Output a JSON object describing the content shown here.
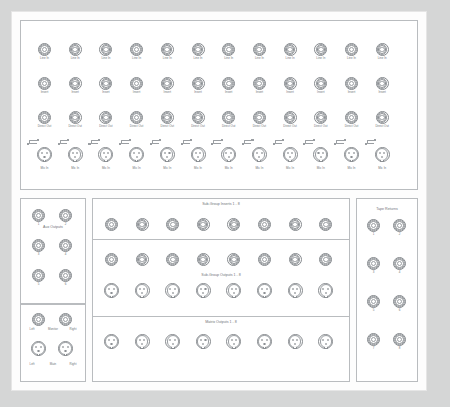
{
  "diagram": {
    "channel_count": 12,
    "row_labels": {
      "line_in": "Line In",
      "insert": "Insert",
      "direct_out": "Direct Out",
      "mic_in": "Mic In"
    }
  },
  "input_panel": {
    "rows": [
      {
        "name": "line-in-row",
        "label": "Line In",
        "type": "trs",
        "count": 12
      },
      {
        "name": "insert-row",
        "label": "Insert",
        "type": "trs",
        "count": 12
      },
      {
        "name": "direct-out-row",
        "label": "Direct Out",
        "type": "trs",
        "count": 12
      },
      {
        "name": "mic-in-row",
        "label": "Mic In",
        "type": "xlr",
        "count": 12
      }
    ]
  },
  "aux_panel": {
    "label": "Aux Outputs",
    "type": "trs",
    "numbers": [
      "1",
      "2",
      "3",
      "4",
      "5",
      "6"
    ]
  },
  "monitor_panel": {
    "monitor": {
      "left": "Left",
      "center": "Monitor",
      "right": "Right",
      "type": "trs"
    },
    "main": {
      "left": "Left",
      "center": "Main",
      "right": "Right",
      "type": "xlr"
    }
  },
  "subgroup_inserts": {
    "label": "Sub-Group Inserts 1 - 8",
    "type": "trs",
    "count": 8
  },
  "subgroup_outputs": {
    "label": "Sub-Group Outputs 1 - 8",
    "trs_count": 8,
    "xlr_count": 8
  },
  "matrix_outputs": {
    "label": "Matrix Outputs 1 - 8",
    "type": "xlr",
    "count": 8
  },
  "tape_returns": {
    "label": "Tape Returns",
    "type": "trs",
    "numbers": [
      "1",
      "2",
      "3",
      "4",
      "5",
      "6",
      "7",
      "8"
    ]
  },
  "colors": {
    "background": "#d5d6d6",
    "sheet": "#fdfdfd",
    "outline": "#b9bcbf",
    "connector": "#85898d",
    "text": "#6e7276"
  }
}
